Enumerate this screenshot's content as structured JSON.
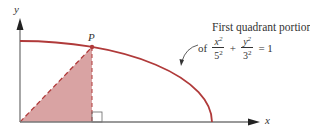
{
  "diagram": {
    "axes": {
      "x_label": "x",
      "y_label": "y"
    },
    "point_label": "P",
    "caption": "First quadrant portion",
    "equation": {
      "prefix": "of",
      "term1": {
        "num": "x",
        "num_exp": "2",
        "den": "5",
        "den_exp": "2"
      },
      "plus": "+",
      "term2": {
        "num": "y",
        "num_exp": "2",
        "den": "3",
        "den_exp": "2"
      },
      "equals": "= 1"
    },
    "colors": {
      "curve": "#b03a3a",
      "shade": "#d9a3a3",
      "axis": "#777777",
      "dashed": "#b03a3a"
    }
  }
}
